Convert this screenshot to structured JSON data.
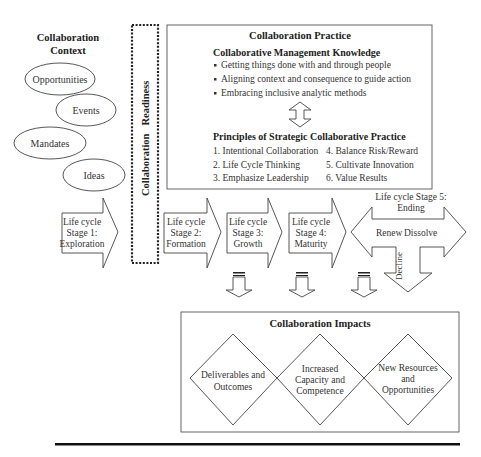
{
  "context": {
    "title_line1": "Collaboration",
    "title_line2": "Context",
    "items": [
      "Opportunities",
      "Events",
      "Mandates",
      "Ideas"
    ]
  },
  "readiness": {
    "label_word1": "Collaboration",
    "label_word2": "Readiness"
  },
  "practice": {
    "title": "Collaboration Practice",
    "knowledge_heading": "Collaborative Management Knowledge",
    "knowledge_items": [
      "Getting things done with and through people",
      "Aligning context and consequence to guide action",
      "Embracing inclusive analytic methods"
    ],
    "principles_heading": "Principles of Strategic Collaborative Practice",
    "principles": [
      "1. Intentional Collaboration",
      "2. Life Cycle Thinking",
      "3. Emphasize Leadership",
      "4.  Balance Risk/Reward",
      "5. Cultivate Innovation",
      "6.  Value Results"
    ]
  },
  "stages": [
    {
      "line1": "Life cycle",
      "line2": "Stage 1:",
      "line3": "Exploration"
    },
    {
      "line1": "Life cycle",
      "line2": "Stage 2:",
      "line3": "Formation"
    },
    {
      "line1": "Life cycle",
      "line2": "Stage 3:",
      "line3": "Growth"
    },
    {
      "line1": "Life cycle",
      "line2": "Stage 4:",
      "line3": "Maturity"
    }
  ],
  "stage5": {
    "title_line1": "Life cycle Stage 5:",
    "title_line2": "Ending",
    "left": "Renew",
    "right": "Dissolve",
    "down": "Decline"
  },
  "impacts": {
    "title": "Collaboration Impacts",
    "items": [
      {
        "line1": "Deliverables and",
        "line2": "Outcomes"
      },
      {
        "line1": "Increased",
        "line2": "Capacity and",
        "line3": "Competence"
      },
      {
        "line1": "New Resources",
        "line2": "and",
        "line3": "Opportunities"
      }
    ]
  }
}
